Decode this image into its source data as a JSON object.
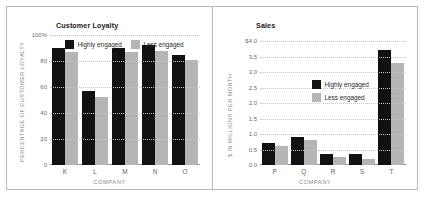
{
  "figure": {
    "panels": [
      "customer-loyalty",
      "sales"
    ],
    "colors": {
      "highly_engaged": "#111111",
      "less_engaged": "#b5b5b5",
      "gridline": "#c4c4c4",
      "axis": "#8e8e8e",
      "frame": "#b9b9b9",
      "tick_text": "#6d6d6d",
      "axis_title_text": "#8a8a8a"
    },
    "legend_labels": {
      "highly_engaged": "Highly engaged",
      "less_engaged": "Less engaged"
    }
  },
  "chart_data": [
    {
      "type": "bar",
      "id": "customer-loyalty",
      "title": "Customer Loyalty",
      "xlabel": "COMPANY",
      "ylabel": "PERCENTAGE OF CUSTOMER LOYALTY",
      "categories": [
        "K",
        "L",
        "M",
        "N",
        "O"
      ],
      "series": [
        {
          "name": "Highly engaged",
          "color": "#111111",
          "values": [
            90,
            57,
            90,
            92,
            85
          ]
        },
        {
          "name": "Less engaged",
          "color": "#b5b5b5",
          "values": [
            87,
            52,
            87,
            88,
            81
          ]
        }
      ],
      "ylim": [
        0,
        100
      ],
      "yticks": [
        100,
        80,
        60,
        40,
        20,
        0
      ],
      "ytick_labels": [
        "100%",
        "80",
        "60",
        "40",
        "20",
        "0"
      ],
      "grid": true,
      "legend_position": "top-inside-horizontal"
    },
    {
      "type": "bar",
      "id": "sales",
      "title": "Sales",
      "xlabel": "COMPANY",
      "ylabel": "$ IN MILLIONS PER MONTH",
      "categories": [
        "P",
        "Q",
        "R",
        "S",
        "T"
      ],
      "series": [
        {
          "name": "Highly engaged",
          "color": "#111111",
          "values": [
            0.7,
            0.9,
            0.35,
            0.35,
            3.7
          ]
        },
        {
          "name": "Less engaged",
          "color": "#b5b5b5",
          "values": [
            0.6,
            0.8,
            0.25,
            0.2,
            3.3
          ]
        }
      ],
      "ylim": [
        0,
        4.0
      ],
      "yticks": [
        4.0,
        3.5,
        3.0,
        2.5,
        2.0,
        1.5,
        1.0,
        0.5,
        0.0
      ],
      "ytick_labels": [
        "$4.0",
        "3.5",
        "3.0",
        "2.5",
        "2.0",
        "1.5",
        "1.0",
        "0.5",
        "0.0"
      ],
      "grid": true,
      "legend_position": "center-inside-vertical"
    }
  ]
}
